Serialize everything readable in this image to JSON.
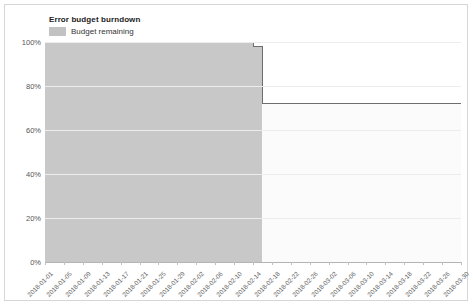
{
  "chart_data": {
    "type": "area",
    "title": "Error budget burndown",
    "xlabel": "",
    "ylabel": "",
    "ylim": [
      0,
      100
    ],
    "ytick_labels": [
      "0%",
      "20%",
      "40%",
      "60%",
      "80%",
      "100%"
    ],
    "ytick_values": [
      0,
      20,
      40,
      60,
      80,
      100
    ],
    "grid": true,
    "legend_position": "top-left",
    "legend": [
      "Budget remaining"
    ],
    "series": [
      {
        "name": "Budget remaining",
        "fill_color": "#c8c8c8",
        "line_color": "#6e6e6e",
        "step": true,
        "x": [
          "2018-01-01",
          "2018-02-13",
          "2018-02-14",
          "2018-02-15",
          "2018-02-16",
          "2018-02-17",
          "2018-03-30"
        ],
        "values": [
          100,
          100,
          98,
          98,
          72,
          72,
          72
        ]
      }
    ],
    "categories": [
      "2018-01-01",
      "2018-01-05",
      "2018-01-09",
      "2018-01-13",
      "2018-01-17",
      "2018-01-21",
      "2018-01-25",
      "2018-01-29",
      "2018-02-02",
      "2018-02-06",
      "2018-02-10",
      "2018-02-14",
      "2018-02-18",
      "2018-02-22",
      "2018-02-26",
      "2018-03-02",
      "2018-03-06",
      "2018-03-10",
      "2018-03-14",
      "2018-03-18",
      "2018-03-22",
      "2018-03-26",
      "2018-03-30"
    ],
    "annotations": [
      {
        "label": "budget drop",
        "x": "2018-02-16",
        "from": 98,
        "to": 72
      }
    ]
  },
  "colors": {
    "fill_left": "#c8c8c8",
    "fill_right": "#fbfbfb",
    "outline": "#6e6e6e",
    "gridline": "#ededed",
    "axis": "#b4b4b4",
    "title_text": "#222222",
    "tick_text": "#666666",
    "card_border": "#d6d6d6"
  }
}
